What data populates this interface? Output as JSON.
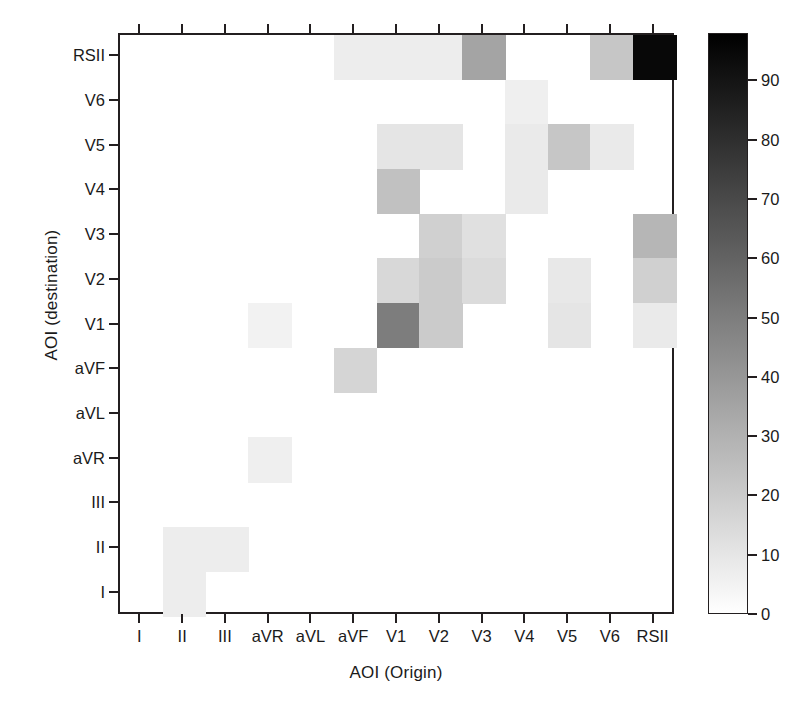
{
  "figure": {
    "type": "heatmap",
    "xlabel": "AOI (Origin)",
    "ylabel": "AOI (destination)"
  },
  "colorbar": {
    "ticks": [
      "0",
      "10",
      "20",
      "30",
      "40",
      "50",
      "60",
      "70",
      "80",
      "90"
    ],
    "tick_values": [
      0,
      10,
      20,
      30,
      40,
      50,
      60,
      70,
      80,
      90
    ],
    "vmin": 0,
    "vmax": 98,
    "low_color": "#ffffff",
    "high_color": "#000000"
  },
  "chart_data": {
    "type": "heatmap",
    "title": "",
    "xlabel": "AOI (Origin)",
    "ylabel": "AOI (destination)",
    "grid": false,
    "legend": "colorbar-right",
    "zlim": [
      0,
      98
    ],
    "x_categories": [
      "I",
      "II",
      "III",
      "aVR",
      "aVL",
      "aVF",
      "V1",
      "V2",
      "V3",
      "V4",
      "V5",
      "V6",
      "RSII"
    ],
    "y_categories_top_to_bottom": [
      "RSII",
      "V6",
      "V5",
      "V4",
      "V3",
      "V2",
      "V1",
      "aVF",
      "aVL",
      "aVR",
      "III",
      "II",
      "I"
    ],
    "values_top_to_bottom": [
      [
        0,
        0,
        0,
        0,
        0,
        7,
        7,
        7,
        35,
        0,
        0,
        22,
        95
      ],
      [
        0,
        0,
        0,
        0,
        0,
        0,
        0,
        0,
        0,
        6,
        0,
        0,
        0
      ],
      [
        0,
        0,
        0,
        0,
        0,
        0,
        10,
        10,
        0,
        8,
        22,
        8,
        0
      ],
      [
        0,
        0,
        0,
        0,
        0,
        0,
        24,
        0,
        0,
        8,
        0,
        0,
        0
      ],
      [
        0,
        0,
        0,
        0,
        0,
        0,
        0,
        18,
        12,
        0,
        0,
        0,
        28
      ],
      [
        0,
        0,
        0,
        0,
        0,
        0,
        15,
        20,
        14,
        0,
        9,
        0,
        18
      ],
      [
        0,
        0,
        0,
        5,
        0,
        0,
        50,
        20,
        0,
        0,
        10,
        0,
        8
      ],
      [
        0,
        0,
        0,
        0,
        0,
        16,
        0,
        0,
        0,
        0,
        0,
        0,
        0
      ],
      [
        0,
        0,
        0,
        0,
        0,
        0,
        0,
        0,
        0,
        0,
        0,
        0,
        0
      ],
      [
        0,
        0,
        0,
        6,
        0,
        0,
        0,
        0,
        0,
        0,
        0,
        0,
        0
      ],
      [
        0,
        0,
        0,
        0,
        0,
        0,
        0,
        0,
        0,
        0,
        0,
        0,
        0
      ],
      [
        0,
        7,
        7,
        0,
        0,
        0,
        0,
        0,
        0,
        0,
        0,
        0,
        0
      ],
      [
        0,
        7,
        0,
        0,
        0,
        0,
        0,
        0,
        0,
        0,
        0,
        0,
        0
      ]
    ]
  }
}
